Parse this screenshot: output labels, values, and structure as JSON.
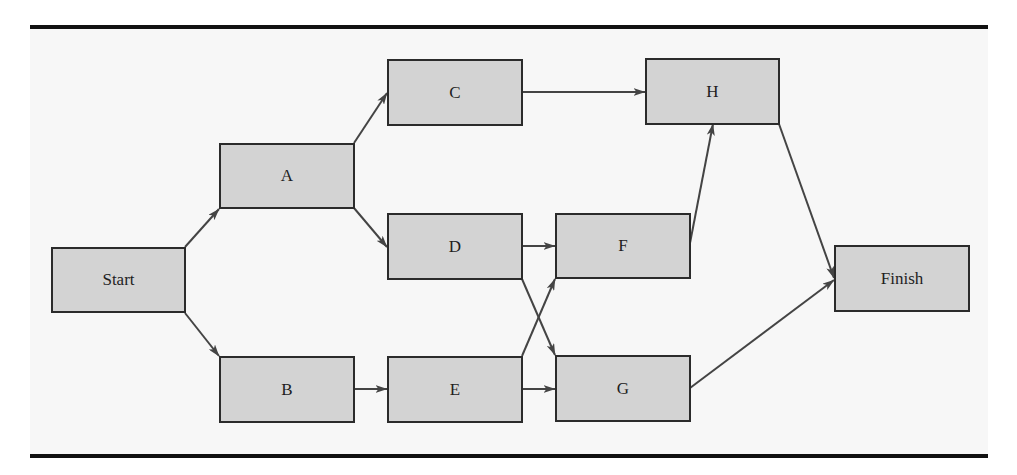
{
  "diagram": {
    "type": "activity-on-node network",
    "nodes": [
      {
        "id": "start",
        "label": "Start",
        "x": 51,
        "y": 247,
        "w": 135,
        "h": 66
      },
      {
        "id": "a",
        "label": "A",
        "x": 219,
        "y": 143,
        "w": 136,
        "h": 66
      },
      {
        "id": "b",
        "label": "B",
        "x": 219,
        "y": 356,
        "w": 136,
        "h": 67
      },
      {
        "id": "c",
        "label": "C",
        "x": 387,
        "y": 59,
        "w": 136,
        "h": 67
      },
      {
        "id": "d",
        "label": "D",
        "x": 387,
        "y": 213,
        "w": 136,
        "h": 67
      },
      {
        "id": "e",
        "label": "E",
        "x": 387,
        "y": 356,
        "w": 136,
        "h": 67
      },
      {
        "id": "f",
        "label": "F",
        "x": 555,
        "y": 213,
        "w": 136,
        "h": 66
      },
      {
        "id": "g",
        "label": "G",
        "x": 555,
        "y": 355,
        "w": 136,
        "h": 67
      },
      {
        "id": "h",
        "label": "H",
        "x": 645,
        "y": 58,
        "w": 135,
        "h": 67
      },
      {
        "id": "finish",
        "label": "Finish",
        "x": 834,
        "y": 245,
        "w": 136,
        "h": 67
      }
    ],
    "edges": [
      {
        "from": "Start",
        "to": "A",
        "x1": 185,
        "y1": 247,
        "x2": 219,
        "y2": 209
      },
      {
        "from": "Start",
        "to": "B",
        "x1": 185,
        "y1": 313,
        "x2": 219,
        "y2": 356
      },
      {
        "from": "A",
        "to": "C",
        "x1": 354,
        "y1": 143,
        "x2": 387,
        "y2": 93
      },
      {
        "from": "A",
        "to": "D",
        "x1": 354,
        "y1": 208,
        "x2": 387,
        "y2": 247
      },
      {
        "from": "B",
        "to": "E",
        "x1": 354,
        "y1": 389,
        "x2": 387,
        "y2": 389
      },
      {
        "from": "C",
        "to": "H",
        "x1": 522,
        "y1": 92,
        "x2": 645,
        "y2": 92
      },
      {
        "from": "D",
        "to": "F",
        "x1": 522,
        "y1": 246,
        "x2": 555,
        "y2": 246
      },
      {
        "from": "D",
        "to": "G",
        "x1": 522,
        "y1": 279,
        "x2": 555,
        "y2": 355
      },
      {
        "from": "E",
        "to": "F",
        "x1": 522,
        "y1": 356,
        "x2": 555,
        "y2": 279
      },
      {
        "from": "E",
        "to": "G",
        "x1": 522,
        "y1": 389,
        "x2": 555,
        "y2": 389
      },
      {
        "from": "F",
        "to": "H",
        "x1": 690,
        "y1": 243,
        "x2": 713,
        "y2": 124
      },
      {
        "from": "H",
        "to": "Finish",
        "x1": 779,
        "y1": 124,
        "x2": 834,
        "y2": 278
      },
      {
        "from": "G",
        "to": "Finish",
        "x1": 690,
        "y1": 388,
        "x2": 834,
        "y2": 280
      }
    ]
  },
  "colors": {
    "node_fill": "#d3d3d3",
    "node_border": "#2b2b2b",
    "edge": "#444444",
    "rule": "#111111",
    "background": "#f7f7f7"
  }
}
